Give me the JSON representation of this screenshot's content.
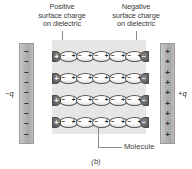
{
  "figure": {
    "caption": "(b)",
    "background_color": "#ffffff"
  },
  "annotations": {
    "positive_surface": {
      "line1": "Positive",
      "line2": "surface charge",
      "line3": "on dielectric"
    },
    "negative_surface": {
      "line1": "Negative",
      "line2": "surface charge",
      "line3": "on dielectric"
    },
    "molecule_label": "Molecule"
  },
  "plates": {
    "left": {
      "charge_label": "−q",
      "sign": "−",
      "sign_count": 9,
      "color": "#b4b4b4"
    },
    "right": {
      "charge_label": "+q",
      "sign": "+",
      "sign_count": 9,
      "color": "#b4b4b4"
    }
  },
  "dielectric": {
    "fill_color": "#e8e6e4",
    "row_count": 4,
    "molecules_per_row": 5,
    "molecule_left_pole": "−",
    "molecule_right_pole": "+",
    "end_cap_left_sign": "+",
    "end_cap_right_sign": "−",
    "rows": [
      {
        "index": 1,
        "top": 50
      },
      {
        "index": 2,
        "top": 72
      },
      {
        "index": 3,
        "top": 94
      },
      {
        "index": 4,
        "top": 116
      }
    ]
  },
  "colors": {
    "plate_gray": "#b4b4b4",
    "dielectric_gray": "#e8e6e4",
    "leader_line": "#8a8a8a",
    "text": "#3a3a3a",
    "end_cap_dark": "#6a6a6a"
  }
}
